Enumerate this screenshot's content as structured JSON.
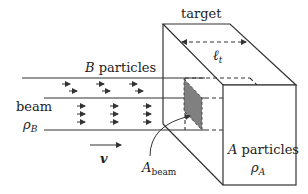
{
  "labels": {
    "target": "target",
    "length": "ℓ",
    "length_sub": "t",
    "b_particles": "B particles",
    "b_letter": "B",
    "b_word": "particles",
    "beam": "beam",
    "rho_b": "ρ",
    "rho_b_sub": "B",
    "velocity": "v",
    "a_beam": "A",
    "a_beam_sub": "beam",
    "a_letter": "A",
    "a_word": "particles",
    "rho_a": "ρ",
    "rho_a_sub": "A"
  },
  "colors": {
    "line": "#333333",
    "shade": "#808080"
  }
}
